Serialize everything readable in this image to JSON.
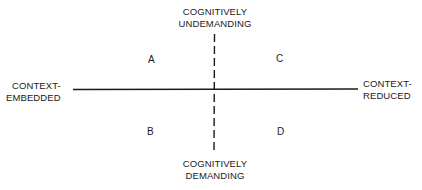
{
  "diagram": {
    "axes": {
      "vertical": {
        "top_label": [
          "COGNITIVELY",
          "UNDEMANDING"
        ],
        "bottom_label": [
          "COGNITIVELY",
          "DEMANDING"
        ],
        "style": "dashed"
      },
      "horizontal": {
        "left_label": [
          "CONTEXT-",
          "EMBEDDED"
        ],
        "right_label": [
          "CONTEXT-",
          "REDUCED"
        ],
        "style": "solid"
      }
    },
    "quadrants": {
      "top_left": "A",
      "top_right": "C",
      "bottom_left": "B",
      "bottom_right": "D"
    },
    "colors": {
      "line": "#1a1a1a",
      "background": "#ffffff"
    }
  }
}
